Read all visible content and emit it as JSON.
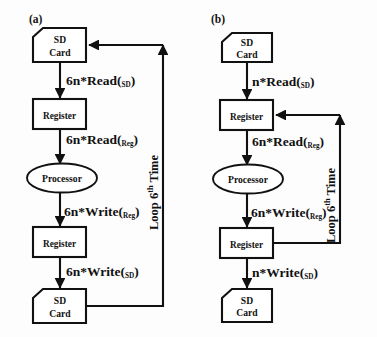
{
  "figure": {
    "background_color": "#fdfdfd",
    "stroke_color": "#111111",
    "fill_color": "#ffffff"
  },
  "panels": [
    {
      "id": "a",
      "label": "(a)",
      "nodes": [
        {
          "id": "a-sd-top",
          "type": "sd-card",
          "lines": [
            "SD",
            "Card"
          ]
        },
        {
          "id": "a-reg-top",
          "type": "rect",
          "lines": [
            "Register"
          ]
        },
        {
          "id": "a-processor",
          "type": "ellipse",
          "lines": [
            "Processor"
          ]
        },
        {
          "id": "a-reg-bot",
          "type": "rect",
          "lines": [
            "Register"
          ]
        },
        {
          "id": "a-sd-bot",
          "type": "sd-card",
          "lines": [
            "SD",
            "Card"
          ]
        }
      ],
      "edges": [
        {
          "id": "a-e1",
          "from": "a-sd-top",
          "to": "a-reg-top",
          "base": "6n*Read",
          "sub": "SD"
        },
        {
          "id": "a-e2",
          "from": "a-reg-top",
          "to": "a-processor",
          "base": "6n*Read",
          "sub": "Reg"
        },
        {
          "id": "a-e3",
          "from": "a-processor",
          "to": "a-reg-bot",
          "base": "6n*Write",
          "sub": "Reg"
        },
        {
          "id": "a-e4",
          "from": "a-reg-bot",
          "to": "a-sd-bot",
          "base": "6n*Write",
          "sub": "SD"
        }
      ],
      "loop": {
        "id": "a-loop",
        "from": "a-sd-bot",
        "to": "a-sd-top",
        "base": "Loop 6",
        "sup": "th",
        "tail": " Time"
      }
    },
    {
      "id": "b",
      "label": "(b)",
      "nodes": [
        {
          "id": "b-sd-top",
          "type": "sd-card",
          "lines": [
            "SD",
            "Card"
          ]
        },
        {
          "id": "b-reg-top",
          "type": "rect",
          "lines": [
            "Register"
          ]
        },
        {
          "id": "b-processor",
          "type": "ellipse",
          "lines": [
            "Processor"
          ]
        },
        {
          "id": "b-reg-bot",
          "type": "rect",
          "lines": [
            "Register"
          ]
        },
        {
          "id": "b-sd-bot",
          "type": "sd-card",
          "lines": [
            "SD",
            "Card"
          ]
        }
      ],
      "edges": [
        {
          "id": "b-e1",
          "from": "b-sd-top",
          "to": "b-reg-top",
          "base": "n*Read",
          "sub": "SD"
        },
        {
          "id": "b-e2",
          "from": "b-reg-top",
          "to": "b-processor",
          "base": "6n*Read",
          "sub": "Reg"
        },
        {
          "id": "b-e3",
          "from": "b-processor",
          "to": "b-reg-bot",
          "base": "6n*Write",
          "sub": "Reg"
        },
        {
          "id": "b-e4",
          "from": "b-reg-bot",
          "to": "b-sd-bot",
          "base": "n*Write",
          "sub": "SD"
        }
      ],
      "loop": {
        "id": "b-loop",
        "from": "b-reg-bot",
        "to": "b-reg-top",
        "base": "Loop 6",
        "sup": "th",
        "tail": " Time"
      }
    }
  ]
}
